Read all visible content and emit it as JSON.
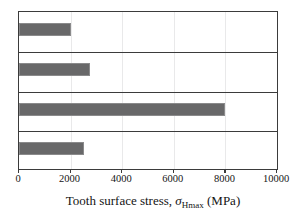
{
  "chart_data": {
    "type": "bar",
    "orientation": "horizontal",
    "title": "",
    "xlabel": "Tooth surface stress, σHmax (MPa)",
    "xlabel_parts": {
      "lead": "Tooth surface stress, ",
      "symbol": "σ",
      "subscript": "Hmax",
      "unit": " (MPa)"
    },
    "ylabel": "",
    "categories": [
      "",
      "",
      "",
      ""
    ],
    "values": [
      2000,
      2750,
      8000,
      2500
    ],
    "xlim": [
      0,
      10000
    ],
    "xticks": [
      0,
      2000,
      4000,
      6000,
      8000,
      10000
    ],
    "xtick_labels": [
      "0",
      "2000",
      "4000",
      "6000",
      "8000",
      "10000"
    ],
    "grid": "vertical-faint",
    "legend": "none",
    "bar_color": "#686869",
    "frame_color": "#3b3b3b",
    "background": "#ffffff"
  }
}
